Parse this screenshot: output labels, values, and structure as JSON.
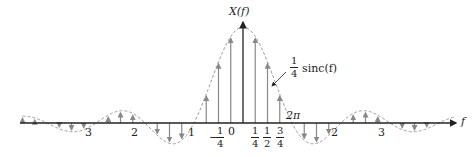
{
  "diagram": {
    "y_axis_label": "X(f)",
    "x_axis_label": "f",
    "envelope_label": {
      "coef_num": "1",
      "coef_den": "4",
      "func": "sinc(f)"
    },
    "period_label": "2π",
    "tick_labels_integer": [
      {
        "text": "3",
        "f": -3
      },
      {
        "text": "2",
        "f": -2
      },
      {
        "text": "1",
        "f": -1
      },
      {
        "text": "0",
        "f": 0
      },
      {
        "text": "2",
        "f": 2
      },
      {
        "text": "3",
        "f": 3
      }
    ],
    "tick_labels_fraction": [
      {
        "sign": "−",
        "num": "1",
        "den": "4",
        "f": -0.25
      },
      {
        "sign": "",
        "num": "1",
        "den": "4",
        "f": 0.25
      },
      {
        "sign": "",
        "num": "1",
        "den": "2",
        "f": 0.5
      },
      {
        "sign": "",
        "num": "3",
        "den": "4",
        "f": 0.75
      }
    ],
    "colors": {
      "axis": "#222222",
      "impulse": "#888888",
      "envelope": "#999999",
      "text": "#222222"
    }
  },
  "chart_data": {
    "type": "line",
    "title": "",
    "xlabel": "f",
    "ylabel": "X(f)",
    "envelope": "(1/4) sinc(f)",
    "impulse_spacing": 0.25,
    "xlim": [
      -4.5,
      4.3
    ],
    "zero_crossings": [
      -4,
      -3,
      -2,
      -1,
      1,
      2,
      3,
      4
    ]
  }
}
